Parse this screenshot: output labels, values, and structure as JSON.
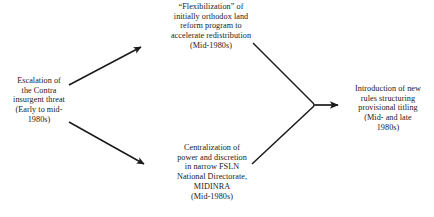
{
  "diagram": {
    "background_color": "#ffffff",
    "line_color": "#1a1a1a",
    "nodes": [
      {
        "id": "escalation",
        "name": "escalation-of-contra-threat",
        "lines": [
          "Escalation of",
          "the Contra",
          "insurgent threat",
          "(Early to mid-",
          "1980s)"
        ]
      },
      {
        "id": "flexibilization",
        "name": "flexibilization-of-land-reform",
        "lines": [
          "“Flexibilization” of",
          "initially orthodox land",
          "reform program to",
          "accelerate redistribution",
          "(Mid-1980s)"
        ]
      },
      {
        "id": "centralization",
        "name": "centralization-of-power",
        "lines": [
          "Centralization of",
          "power and discretion",
          "in narrow FSLN",
          "National Directorate,",
          "MIDINRA",
          "(Mid-1980s)"
        ]
      },
      {
        "id": "introduction",
        "name": "introduction-of-new-rules",
        "lines": [
          "Introduction of new",
          "rules structuring",
          "provisional titling",
          "(Mid- and late",
          "1980s)"
        ]
      }
    ],
    "arrows": [
      {
        "id": "escalation-to-flexibilization",
        "from": "escalation",
        "to": "flexibilization",
        "arrowhead": "end"
      },
      {
        "id": "escalation-to-centralization",
        "from": "escalation",
        "to": "centralization",
        "arrowhead": "end"
      },
      {
        "id": "flexibilization-to-introduction",
        "from": "flexibilization",
        "to": "introduction",
        "arrowhead": "end"
      },
      {
        "id": "centralization-to-introduction",
        "from": "centralization",
        "to": "introduction",
        "arrowhead": "end"
      }
    ]
  }
}
